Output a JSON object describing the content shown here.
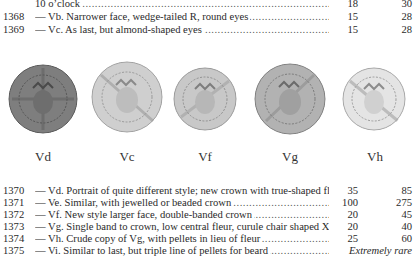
{
  "top_rows": [
    {
      "number": "",
      "description": "10 o’clock",
      "value1": "18",
      "value2": "30"
    },
    {
      "number": "1368",
      "description": "— Vb. Narrower face, wedge-tailed R, round eyes",
      "value1": "15",
      "value2": "28"
    },
    {
      "number": "1369",
      "description": "— Vc. As last, but almond-shaped eyes",
      "value1": "15",
      "value2": "28"
    }
  ],
  "coins": [
    {
      "label": "Vd",
      "tone": "#7d7d7d",
      "edge": "#5e5e5e"
    },
    {
      "label": "Vc",
      "tone": "#c9c9c9",
      "edge": "#9a9a9a"
    },
    {
      "label": "Vf",
      "tone": "#c4c4c4",
      "edge": "#959595"
    },
    {
      "label": "Vg",
      "tone": "#adadad",
      "edge": "#7d7d7d"
    },
    {
      "label": "Vh",
      "tone": "#e2e2e2",
      "edge": "#a8a8a8"
    }
  ],
  "bottom_rows": [
    {
      "number": "1370",
      "description": "— Vd. Portrait of quite different style; new crown with true-shaped fleur",
      "value1": "35",
      "value2": "85"
    },
    {
      "number": "1371",
      "description": "— Ve. Similar, with jewelled or beaded crown",
      "value1": "100",
      "value2": "275"
    },
    {
      "number": "1372",
      "description": "— Vf. New style larger face, double-banded crown",
      "value1": "20",
      "value2": "45"
    },
    {
      "number": "1373",
      "description": "— Vg. Single band to crown, low central fleur, curule chair shaped X ...",
      "value1": "20",
      "value2": "40"
    },
    {
      "number": "1374",
      "description": "— Vh. Crude copy of Vg, with pellets in lieu of fleur",
      "value1": "25",
      "value2": "60"
    },
    {
      "number": "1375",
      "description": "— Vi. Similar to last, but triple line of pellets for beard",
      "rarity": "Extremely rare"
    }
  ]
}
